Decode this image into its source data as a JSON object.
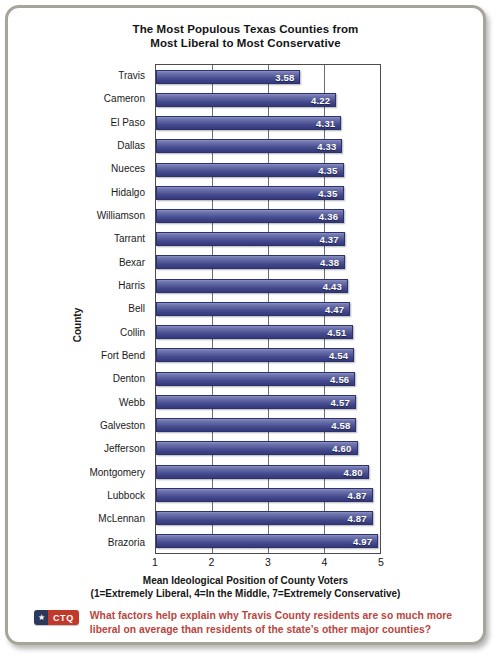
{
  "chart_data": {
    "type": "bar",
    "orientation": "horizontal",
    "title": "The Most Populous Texas Counties from Most Liberal to Most Conservative",
    "title_line1": "The Most Populous Texas Counties from",
    "title_line2": "Most Liberal to Most Conservative",
    "xlabel": "Mean Ideological Position of County Voters",
    "xlabel_note": "(1=Extremely Liberal, 4=In the Middle, 7=Extremely Conservative)",
    "ylabel": "County",
    "xlim": [
      1,
      5
    ],
    "xticks": [
      "1",
      "2",
      "3",
      "4",
      "5"
    ],
    "grid": true,
    "legend": "none",
    "categories": [
      "Travis",
      "Cameron",
      "El Paso",
      "Dallas",
      "Nueces",
      "Hidalgo",
      "Williamson",
      "Tarrant",
      "Bexar",
      "Harris",
      "Bell",
      "Collin",
      "Fort Bend",
      "Denton",
      "Webb",
      "Galveston",
      "Jefferson",
      "Montgomery",
      "Lubbock",
      "McLennan",
      "Brazoria"
    ],
    "values": [
      3.58,
      4.22,
      4.31,
      4.33,
      4.35,
      4.35,
      4.36,
      4.37,
      4.38,
      4.43,
      4.47,
      4.51,
      4.54,
      4.56,
      4.57,
      4.58,
      4.6,
      4.8,
      4.87,
      4.87,
      4.97
    ],
    "value_labels": [
      "3.58",
      "4.22",
      "4.31",
      "4.33",
      "4.35",
      "4.35",
      "4.36",
      "4.37",
      "4.38",
      "4.43",
      "4.47",
      "4.51",
      "4.54",
      "4.56",
      "4.57",
      "4.58",
      "4.60",
      "4.80",
      "4.87",
      "4.87",
      "4.97"
    ],
    "bar_color": "#474d8e",
    "bar_color_light": "#8e93c4"
  },
  "footer": {
    "badge_star": "★",
    "badge_label": "CTQ",
    "badge_navy": "#2b3a5c",
    "badge_red": "#c0392b",
    "question": "What factors help explain why Travis County residents are so much more liberal on average than residents of the state’s other major counties?",
    "question_color": "#b9443c"
  }
}
